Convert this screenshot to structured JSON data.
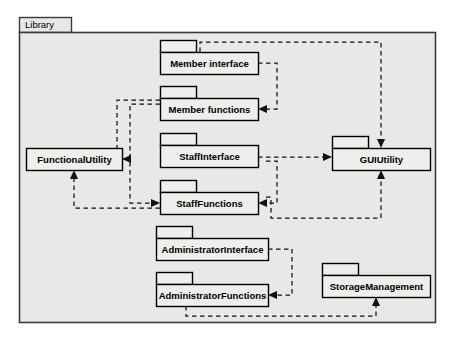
{
  "diagram": {
    "type": "uml-package-diagram",
    "container": {
      "name": "Library",
      "label": "Library"
    },
    "packages": [
      {
        "id": "member_interface",
        "label": "Member interface",
        "has_tab": true,
        "x": 160,
        "y": 52,
        "w": 98,
        "h": 22
      },
      {
        "id": "member_functions",
        "label": "Member functions",
        "has_tab": true,
        "x": 160,
        "y": 98,
        "w": 98,
        "h": 22
      },
      {
        "id": "functional_utility",
        "label": "FunctionalUtility",
        "has_tab": false,
        "x": 26,
        "y": 148,
        "w": 96,
        "h": 22
      },
      {
        "id": "staff_interface",
        "label": "StaffInterface",
        "has_tab": true,
        "x": 160,
        "y": 145,
        "w": 98,
        "h": 22
      },
      {
        "id": "staff_functions",
        "label": "StaffFunctions",
        "has_tab": true,
        "x": 160,
        "y": 192,
        "w": 98,
        "h": 22
      },
      {
        "id": "gui_utility",
        "label": "GUIUtility",
        "has_tab": true,
        "x": 332,
        "y": 148,
        "w": 98,
        "h": 22
      },
      {
        "id": "administrator_interface",
        "label": "AdministratorInterface",
        "has_tab": true,
        "x": 156,
        "y": 238,
        "w": 112,
        "h": 22
      },
      {
        "id": "administrator_functions",
        "label": "AdministratorFunctions",
        "has_tab": true,
        "x": 156,
        "y": 284,
        "w": 112,
        "h": 22
      },
      {
        "id": "storage_management",
        "label": "StorageManagement",
        "has_tab": true,
        "x": 322,
        "y": 275,
        "w": 108,
        "h": 22
      }
    ],
    "dependencies": [
      {
        "from": "member_interface",
        "to": "gui_utility",
        "style": "dashed",
        "arrow": "open"
      },
      {
        "from": "member_interface",
        "to": "member_functions",
        "style": "dashed",
        "arrow": "open"
      },
      {
        "from": "member_functions",
        "to": "staff_functions",
        "style": "dashed",
        "arrow": "open"
      },
      {
        "from": "member_functions",
        "to": "functional_utility",
        "style": "dashed",
        "arrow": "open"
      },
      {
        "from": "staff_interface",
        "to": "gui_utility",
        "style": "dashed",
        "arrow": "open"
      },
      {
        "from": "staff_interface",
        "to": "staff_functions",
        "style": "dashed",
        "arrow": "open"
      },
      {
        "from": "staff_functions",
        "to": "functional_utility",
        "style": "dashed",
        "arrow": "open"
      },
      {
        "from": "staff_functions",
        "to": "gui_utility",
        "style": "dashed",
        "arrow": "open"
      },
      {
        "from": "administrator_interface",
        "to": "administrator_functions",
        "style": "dashed",
        "arrow": "open"
      },
      {
        "from": "administrator_functions",
        "to": "storage_management",
        "style": "dashed",
        "arrow": "open"
      }
    ],
    "colors": {
      "box_fill": "#eeeeec",
      "container_fill": "#e8e8e6",
      "stroke": "#000000",
      "container_stroke": "#3a3a3a",
      "background": "#ffffff"
    }
  }
}
